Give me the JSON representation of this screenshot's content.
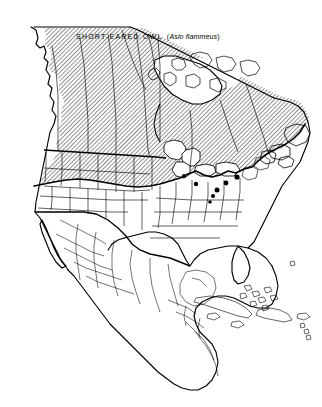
{
  "figure": {
    "kind": "range-map",
    "region": "North America",
    "background_color": "#ffffff",
    "ink_color": "#000000"
  },
  "title": {
    "common_name": "SHORT-EARED OWL",
    "scientific_open": "(",
    "scientific_name": "Asio flammeus",
    "scientific_close": ")"
  },
  "legend": {
    "range_fill": "diagonal-hatch",
    "hatch_angle_degrees": 45,
    "hatch_spacing_px": 3,
    "hatch_color": "#000000",
    "unshaded_color": "#ffffff"
  },
  "map": {
    "coastline_color": "#000000",
    "national_border_color": "#000000",
    "internal_border_color": "#000000",
    "range_boundary_color": "#000000",
    "isolated_record_color": "#000000"
  }
}
